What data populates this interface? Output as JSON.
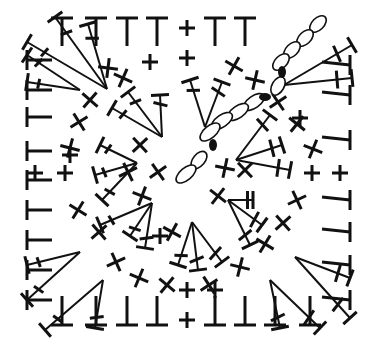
{
  "diagram": {
    "ink_color": "#111111",
    "background": "#ffffff",
    "bounds": {
      "left": 24,
      "top": 15,
      "right": 353,
      "bottom": 327
    },
    "legend": {
      "T": "half double crochet (edge)",
      "plus": "single crochet",
      "cross": "single crochet (angled)",
      "fan": "tall stitch cluster",
      "chain": "chain stitch",
      "dot": "slip stitch"
    }
  },
  "stitches": {
    "top_T": [
      [
        62,
        28
      ],
      [
        96,
        28
      ],
      [
        127,
        28
      ],
      [
        157,
        28
      ],
      [
        215,
        28
      ],
      [
        245,
        28
      ]
    ],
    "bottom_T": [
      [
        62,
        318
      ],
      [
        96,
        318
      ],
      [
        127,
        318
      ],
      [
        157,
        318
      ],
      [
        215,
        318
      ],
      [
        245,
        318
      ],
      [
        275,
        318
      ],
      [
        310,
        318
      ]
    ],
    "left_T": [
      [
        27,
        60
      ],
      [
        27,
        90
      ],
      [
        27,
        117
      ],
      [
        27,
        151
      ],
      [
        27,
        180
      ],
      [
        27,
        210
      ],
      [
        27,
        240
      ],
      [
        27,
        270
      ],
      [
        27,
        300
      ]
    ],
    "right_T": [
      [
        350,
        65
      ],
      [
        350,
        95
      ],
      [
        350,
        140
      ],
      [
        350,
        200
      ],
      [
        350,
        232
      ],
      [
        350,
        265
      ],
      [
        350,
        300
      ]
    ],
    "plus": [
      [
        187,
        28
      ],
      [
        187,
        290
      ],
      [
        187,
        320
      ],
      [
        35,
        173
      ],
      [
        65,
        173
      ],
      [
        150,
        62
      ],
      [
        187,
        58
      ],
      [
        312,
        173
      ],
      [
        340,
        173
      ],
      [
        160,
        236
      ],
      [
        215,
        290
      ],
      [
        70,
        155
      ],
      [
        300,
        118
      ]
    ],
    "cross": [
      [
        108,
        68
      ],
      [
        123,
        78
      ],
      [
        90,
        100
      ],
      [
        79,
        122
      ],
      [
        70,
        148
      ],
      [
        78,
        210
      ],
      [
        99,
        232
      ],
      [
        116,
        262
      ],
      [
        139,
        278
      ],
      [
        167,
        285
      ],
      [
        209,
        285
      ],
      [
        240,
        267
      ],
      [
        265,
        244
      ],
      [
        283,
        223
      ],
      [
        297,
        200
      ],
      [
        313,
        149
      ],
      [
        297,
        124
      ],
      [
        278,
        102
      ],
      [
        255,
        80
      ],
      [
        234,
        66
      ],
      [
        140,
        145
      ],
      [
        128,
        172
      ],
      [
        142,
        196
      ],
      [
        218,
        196
      ],
      [
        158,
        172
      ],
      [
        225,
        168
      ],
      [
        172,
        232
      ],
      [
        245,
        170
      ]
    ],
    "chains": [
      {
        "cx": 318,
        "cy": 24,
        "rx": 10,
        "ry": 6,
        "rot": -45
      },
      {
        "cx": 305,
        "cy": 38,
        "rx": 10,
        "ry": 6,
        "rot": -45
      },
      {
        "cx": 292,
        "cy": 50,
        "rx": 10,
        "ry": 6,
        "rot": -45
      },
      {
        "cx": 281,
        "cy": 62,
        "rx": 10,
        "ry": 6,
        "rot": -45
      },
      {
        "cx": 278,
        "cy": 86,
        "rx": 10,
        "ry": 6,
        "rot": -60
      },
      {
        "cx": 254,
        "cy": 102,
        "rx": 12,
        "ry": 6,
        "rot": -35
      },
      {
        "cx": 238,
        "cy": 112,
        "rx": 12,
        "ry": 6,
        "rot": -35
      },
      {
        "cx": 222,
        "cy": 121,
        "rx": 12,
        "ry": 6,
        "rot": -35
      },
      {
        "cx": 210,
        "cy": 132,
        "rx": 12,
        "ry": 6,
        "rot": -40
      },
      {
        "cx": 199,
        "cy": 160,
        "rx": 10,
        "ry": 6,
        "rot": -50
      },
      {
        "cx": 186,
        "cy": 174,
        "rx": 12,
        "ry": 6,
        "rot": -40
      }
    ],
    "dots": [
      {
        "cx": 282,
        "cy": 72,
        "rx": 4,
        "ry": 6,
        "rot": 0
      },
      {
        "cx": 265,
        "cy": 97,
        "rx": 6,
        "ry": 4,
        "rot": 0
      },
      {
        "cx": 213,
        "cy": 145,
        "rx": 4,
        "ry": 6,
        "rot": 0
      }
    ]
  },
  "fans": [
    {
      "name": "fan-top-left-outer",
      "apex": [
        107,
        89
      ],
      "tips": [
        [
          55,
          17
        ],
        [
          88,
          24
        ],
        [
          27,
          42
        ]
      ]
    },
    {
      "name": "fan-left-upper",
      "apex": [
        80,
        90
      ],
      "tips": [
        [
          27,
          55
        ],
        [
          27,
          82
        ]
      ]
    },
    {
      "name": "fan-top-right-outer",
      "apex": [
        284,
        85
      ],
      "tips": [
        [
          352,
          45
        ],
        [
          352,
          78
        ]
      ]
    },
    {
      "name": "fan-left-lower",
      "apex": [
        80,
        252
      ],
      "tips": [
        [
          27,
          265
        ],
        [
          27,
          300
        ]
      ]
    },
    {
      "name": "fan-bottom-left",
      "apex": [
        103,
        280
      ],
      "tips": [
        [
          45,
          330
        ],
        [
          95,
          328
        ]
      ]
    },
    {
      "name": "fan-right-lower",
      "apex": [
        295,
        257
      ],
      "tips": [
        [
          350,
          278
        ],
        [
          350,
          318
        ]
      ]
    },
    {
      "name": "fan-bottom-right",
      "apex": [
        270,
        280
      ],
      "tips": [
        [
          280,
          328
        ],
        [
          320,
          328
        ]
      ]
    },
    {
      "name": "fan-inner-top-left",
      "apex": [
        162,
        137
      ],
      "tips": [
        [
          128,
          92
        ],
        [
          112,
          108
        ],
        [
          160,
          95
        ]
      ]
    },
    {
      "name": "fan-inner-top",
      "apex": [
        205,
        127
      ],
      "tips": [
        [
          190,
          80
        ],
        [
          222,
          82
        ]
      ]
    },
    {
      "name": "fan-inner-right",
      "apex": [
        236,
        160
      ],
      "tips": [
        [
          270,
          115
        ],
        [
          282,
          145
        ],
        [
          290,
          170
        ]
      ]
    },
    {
      "name": "fan-inner-left",
      "apex": [
        137,
        163
      ],
      "tips": [
        [
          100,
          145
        ],
        [
          95,
          175
        ],
        [
          102,
          200
        ]
      ]
    },
    {
      "name": "fan-inner-bottom-left",
      "apex": [
        152,
        203
      ],
      "tips": [
        [
          100,
          225
        ],
        [
          130,
          236
        ],
        [
          145,
          248
        ]
      ]
    },
    {
      "name": "fan-inner-bottom",
      "apex": [
        192,
        222
      ],
      "tips": [
        [
          178,
          265
        ],
        [
          198,
          270
        ],
        [
          222,
          262
        ]
      ]
    },
    {
      "name": "fan-inner-bottom-right",
      "apex": [
        228,
        200
      ],
      "tips": [
        [
          253,
          200
        ],
        [
          262,
          225
        ],
        [
          250,
          245
        ]
      ]
    }
  ]
}
